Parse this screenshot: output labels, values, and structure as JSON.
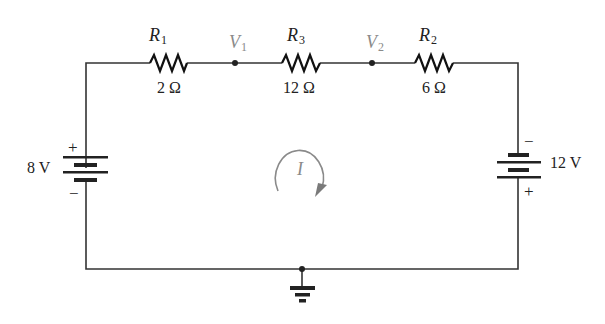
{
  "diagram": {
    "type": "circuit",
    "colors": {
      "wire": "#333333",
      "node_label": "#8a8a8a",
      "loop": "#8a8a8a"
    },
    "resistors": [
      {
        "id": "R1",
        "symbol": "R",
        "subscript": "1",
        "value": "2 Ω"
      },
      {
        "id": "R3",
        "symbol": "R",
        "subscript": "3",
        "value": "12 Ω"
      },
      {
        "id": "R2",
        "symbol": "R",
        "subscript": "2",
        "value": "6 Ω"
      }
    ],
    "nodes": [
      {
        "id": "V1",
        "symbol": "V",
        "subscript": "1"
      },
      {
        "id": "V2",
        "symbol": "V",
        "subscript": "2"
      }
    ],
    "sources": [
      {
        "id": "E1",
        "value": "8 V",
        "top_sign": "+",
        "bottom_sign": "−"
      },
      {
        "id": "E2",
        "value": "12 V",
        "top_sign": "−",
        "bottom_sign": "+"
      }
    ],
    "loop_current": {
      "label": "I",
      "direction": "clockwise"
    },
    "ground": {
      "label": "ground"
    }
  }
}
